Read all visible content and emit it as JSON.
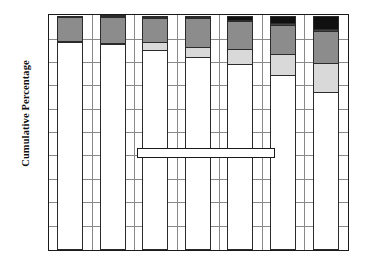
{
  "chart_data": {
    "type": "bar",
    "stacked": true,
    "title": "",
    "xlabel": "",
    "ylabel": "Cumulative Percentage",
    "ylim": [
      0,
      100
    ],
    "grid": true,
    "legend_position": "inside-center",
    "categories": [
      "1940",
      "1950",
      "1960",
      "1970",
      "1980",
      "1990",
      "2000"
    ],
    "ytick_labels": [
      "0%",
      "10%",
      "20%",
      "30%",
      "40%",
      "50%",
      "60%",
      "70%",
      "80%",
      "90%",
      "100%"
    ],
    "ytick_values": [
      0,
      10,
      20,
      30,
      40,
      50,
      60,
      70,
      80,
      90,
      100
    ],
    "series": [
      {
        "name": "Non-Hispanic White",
        "color": "#ffffff",
        "values": [
          88.8,
          88.0,
          85.5,
          82.5,
          79.6,
          74.7,
          67.6
        ]
      },
      {
        "name": "Hispanic",
        "color": "#d9d9d9",
        "values": [
          0.3,
          0.7,
          3.3,
          4.5,
          6.2,
          9.0,
          12.5
        ]
      },
      {
        "name": "Black",
        "color": "#8c8c8c",
        "values": [
          10.6,
          10.9,
          10.6,
          12.3,
          12.1,
          12.6,
          13.6
        ]
      },
      {
        "name": "Amerindian",
        "color": "#434343",
        "values": [
          0.3,
          0.3,
          0.4,
          0.4,
          0.6,
          0.8,
          0.9
        ]
      },
      {
        "name": "Asian",
        "color": "#101010",
        "values": [
          0.0,
          0.1,
          0.2,
          0.3,
          1.5,
          2.9,
          5.4
        ]
      }
    ],
    "legend_entries": [
      {
        "label": "Asian",
        "color": "#101010"
      },
      {
        "label": "Amerindian",
        "color": "#434343"
      },
      {
        "label": "Black",
        "color": "#8c8c8c"
      },
      {
        "label": "Hispanic",
        "color": "#d9d9d9"
      },
      {
        "label": "Non-Hispanic White",
        "color": "#ffffff"
      }
    ],
    "axis_color": "#1a1a1a",
    "grid_color": "#8a8a8a"
  }
}
